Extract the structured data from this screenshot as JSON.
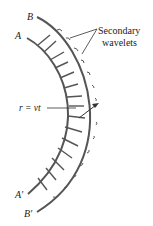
{
  "diagram": {
    "type": "huygens-principle",
    "labels": {
      "wavefront_a_start": "A",
      "wavefront_a_end": "A′",
      "wavefront_b_start": "B",
      "wavefront_b_end": "B′",
      "radius": "r = vt",
      "wavelets_line1": "Secondary",
      "wavelets_line2": "wavelets"
    },
    "colors": {
      "curve": "#555555",
      "text": "#222222",
      "background": "#ffffff"
    }
  }
}
